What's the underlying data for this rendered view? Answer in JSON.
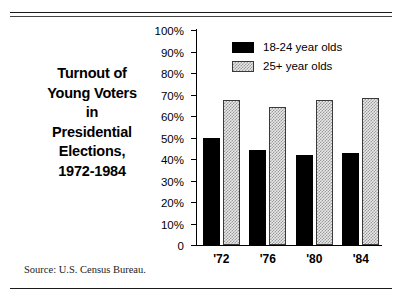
{
  "title_lines": [
    "Turnout of",
    "Young Voters",
    "in",
    "Presidential",
    "Elections,",
    "1972-1984"
  ],
  "source": "Source: U.S. Census Bureau.",
  "colors": {
    "series_1": "#000000",
    "series_2": "#d0d0d0",
    "axis": "#000000"
  },
  "chart_data": {
    "type": "bar",
    "title": "Turnout of Young Voters in Presidential Elections, 1972-1984",
    "xlabel": "",
    "ylabel": "",
    "categories": [
      "'72",
      "'76",
      "'80",
      "'84"
    ],
    "series": [
      {
        "name": "18-24 year olds",
        "values": [
          50.0,
          44.0,
          42.0,
          43.0
        ]
      },
      {
        "name": "25+ year olds",
        "values": [
          67.5,
          64.0,
          67.5,
          68.5
        ]
      }
    ],
    "ylim": [
      0,
      100
    ],
    "yticks": [
      0,
      10,
      20,
      30,
      40,
      50,
      60,
      70,
      80,
      90,
      100
    ],
    "ytick_labels": [
      "0",
      "10%",
      "20%",
      "30%",
      "40%",
      "50%",
      "60%",
      "70%",
      "80%",
      "90%",
      "100%"
    ],
    "grid": false,
    "legend_position": "top-right"
  }
}
